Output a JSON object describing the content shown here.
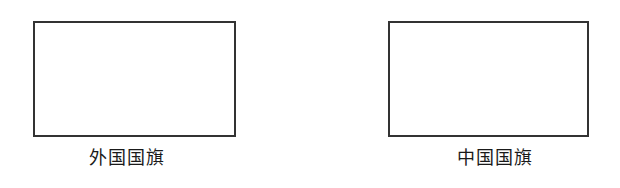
{
  "figures": [
    {
      "id": "foreign-flag",
      "caption": "外国国旗",
      "frame_color": "#333333"
    },
    {
      "id": "chinese-flag",
      "caption": "中国国旗",
      "frame_color": "#333333"
    }
  ]
}
